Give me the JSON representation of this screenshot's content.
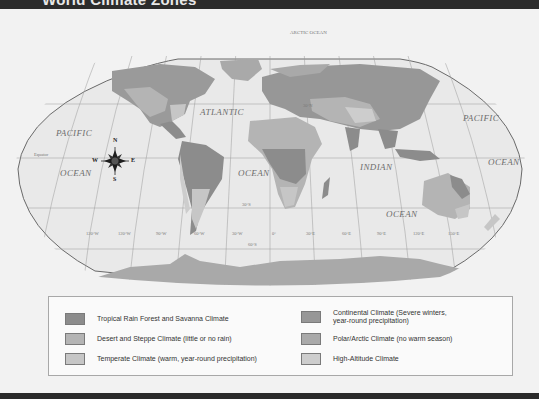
{
  "header": {
    "title": "World Climate Zones"
  },
  "map": {
    "ocean_labels": [
      {
        "text": "PACIFIC",
        "x": 56,
        "y": 128
      },
      {
        "text": "OCEAN",
        "x": 60,
        "y": 168
      },
      {
        "text": "ATLANTIC",
        "x": 200,
        "y": 107
      },
      {
        "text": "OCEAN",
        "x": 238,
        "y": 168
      },
      {
        "text": "INDIAN",
        "x": 360,
        "y": 162
      },
      {
        "text": "OCEAN",
        "x": 386,
        "y": 209
      },
      {
        "text": "PACIFIC",
        "x": 463,
        "y": 113
      },
      {
        "text": "OCEAN",
        "x": 488,
        "y": 157
      },
      {
        "text": "ARCTIC OCEAN",
        "x": 290,
        "y": 26
      }
    ],
    "line_labels": [
      {
        "text": "Equator",
        "x": 34,
        "y": 150
      },
      {
        "text": "30°N",
        "x": 303,
        "y": 102
      },
      {
        "text": "30°S",
        "x": 242,
        "y": 200
      },
      {
        "text": "60°S",
        "x": 248,
        "y": 249
      },
      {
        "text": "120°W",
        "x": 86,
        "y": 231
      },
      {
        "text": "120°W",
        "x": 118,
        "y": 231
      },
      {
        "text": "90°W",
        "x": 156,
        "y": 231
      },
      {
        "text": "60°W",
        "x": 194,
        "y": 231
      },
      {
        "text": "30°W",
        "x": 232,
        "y": 231
      },
      {
        "text": "0°",
        "x": 272,
        "y": 231
      },
      {
        "text": "30°E",
        "x": 306,
        "y": 231
      },
      {
        "text": "60°E",
        "x": 342,
        "y": 231
      },
      {
        "text": "90°E",
        "x": 377,
        "y": 231
      },
      {
        "text": "120°E",
        "x": 413,
        "y": 231
      },
      {
        "text": "150°E",
        "x": 448,
        "y": 231
      }
    ],
    "compass": {
      "n": "N",
      "s": "S",
      "e": "E",
      "w": "W"
    }
  },
  "legend": {
    "items": [
      {
        "label": "Tropical Rain Forest and Savanna Climate",
        "color": "#8c8c8c"
      },
      {
        "label": "Desert and Steppe Climate (little or no rain)",
        "color": "#b4b4b4"
      },
      {
        "label": "Temperate Climate (warm, year-round precipitation)",
        "color": "#c6c6c6"
      },
      {
        "label": "Continental Climate (Severe winters,",
        "label2": "year-round precipitation)",
        "color": "#979797"
      },
      {
        "label": "Polar/Arctic Climate (no warm season)",
        "color": "#a9a9a9"
      },
      {
        "label": "High-Altitude Climate",
        "color": "#cdcdcd"
      }
    ]
  }
}
